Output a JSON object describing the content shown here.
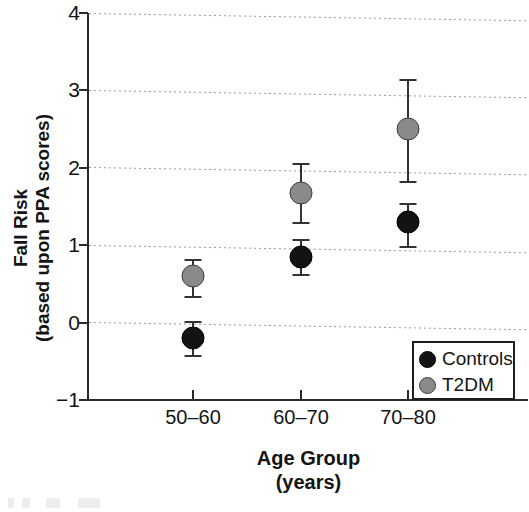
{
  "chart_data": {
    "type": "scatter",
    "title": "",
    "xlabel": "Age Group",
    "xlabel_sub": "(years)",
    "ylabel": "Fall Risk",
    "ylabel_sub": "(based upon PPA scores)",
    "categories": [
      "50–60",
      "60–70",
      "70–80"
    ],
    "ylim": [
      -1,
      4
    ],
    "yticks": [
      4,
      3,
      2,
      1,
      0,
      -1
    ],
    "ytick_labels": [
      "4",
      "3",
      "2",
      "1",
      "0",
      "−1"
    ],
    "grid": "horizontal-dotted",
    "legend_position": "bottom-right",
    "error_type": "error bars (upper/lower)",
    "series": [
      {
        "name": "Controls",
        "color": "#131313",
        "values": [
          -0.2,
          0.85,
          1.3
        ],
        "err_low": [
          -0.45,
          0.6,
          0.97
        ],
        "err_high": [
          0.02,
          1.08,
          1.55
        ]
      },
      {
        "name": "T2DM",
        "color": "#8a8a8a",
        "values": [
          0.6,
          1.68,
          2.5
        ],
        "err_low": [
          0.32,
          1.28,
          1.8
        ],
        "err_high": [
          0.82,
          2.06,
          3.15
        ]
      }
    ]
  },
  "axes": {
    "y_title_line1": "Fall Risk",
    "y_title_line2": "(based upon PPA scores)",
    "x_title_line1": "Age Group",
    "x_title_line2": "(years)"
  },
  "legend": {
    "items": [
      {
        "label": "Controls",
        "color": "#131313"
      },
      {
        "label": "T2DM",
        "color": "#8a8a8a"
      }
    ]
  },
  "colors": {
    "controls": "#131313",
    "t2dm": "#8a8a8a",
    "axis": "#2b2b2b",
    "grid": "#9a9a9a",
    "background": "#ffffff"
  }
}
